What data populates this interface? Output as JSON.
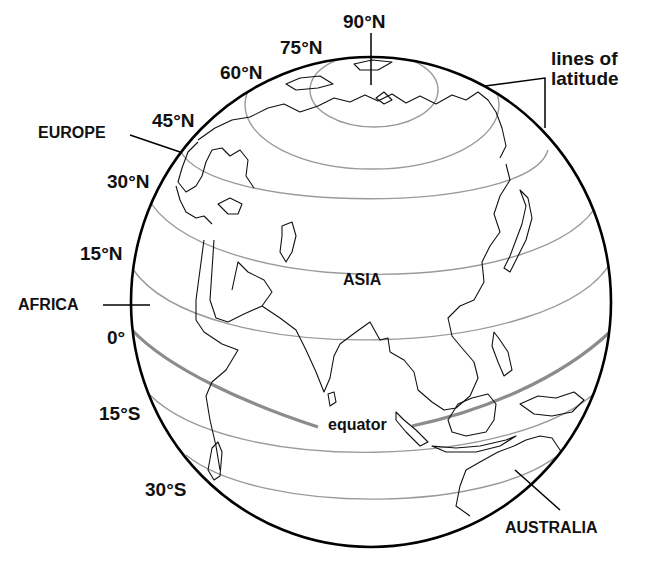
{
  "diagram": {
    "colors": {
      "globe_outline": "#000000",
      "latitude_lines": "#9a9a9a",
      "equator_line": "#8c8c8c",
      "coastlines": "#111111",
      "background": "#ffffff"
    },
    "latitude_labels": {
      "n90": "90°N",
      "n75": "75°N",
      "n60": "60°N",
      "n45": "45°N",
      "n30": "30°N",
      "n15": "15°N",
      "zero": "0°",
      "s15": "15°S",
      "s30": "30°S"
    },
    "region_labels": {
      "europe": "EUROPE",
      "africa": "AFRICA",
      "asia": "ASIA",
      "australia": "AUSTRALIA"
    },
    "annotations": {
      "equator": "equator",
      "lines_of_latitude_line1": "lines of",
      "lines_of_latitude_line2": "latitude"
    }
  }
}
